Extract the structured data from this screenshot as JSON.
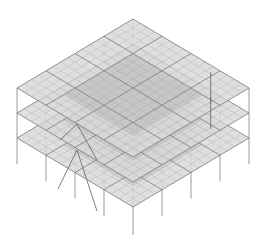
{
  "diagram": {
    "type": "isometric-structural-model",
    "view": "isometric",
    "colors": {
      "background": "#ffffff",
      "slab_fill": "#d9d9d9",
      "slab_core_fill": "#b8b8b8",
      "mesh_line": "#a8a8a8",
      "edge_line": "#7a7a7a",
      "column_line": "#9a9a9a",
      "brace_line": "#6e6e6e"
    },
    "geometry": {
      "apex": [
        133,
        19
      ],
      "left": [
        17,
        88
      ],
      "right": [
        249,
        88
      ],
      "bottom": [
        135,
        158
      ],
      "floor_spacing": 25,
      "mesh_divisions": 16,
      "bay_divisions": 4
    },
    "floors": [
      {
        "label": "Roof slab",
        "offset": 0
      },
      {
        "label": "Level 2 slab",
        "offset": 25
      },
      {
        "label": "Level 1 slab",
        "offset": 50
      }
    ],
    "columns": [
      {
        "label": "Left column",
        "base_offset": 78
      },
      {
        "label": "Right column",
        "base_offset": 78
      },
      {
        "label": "Front column",
        "base_offset": 78
      },
      {
        "label": "Inner left column",
        "base_offset": 72
      },
      {
        "label": "Inner right column",
        "base_offset": 72
      },
      {
        "label": "Mid-front-left column",
        "base_offset": 75
      },
      {
        "label": "Mid-front-right column",
        "base_offset": 75
      }
    ],
    "bracing": [
      {
        "label": "Right bay X-brace"
      },
      {
        "label": "Front-left bay diagonal brace"
      }
    ]
  }
}
